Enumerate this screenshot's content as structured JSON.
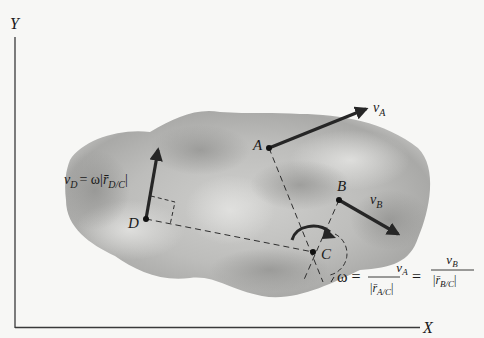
{
  "figure": {
    "axes": {
      "y_label": "Y",
      "x_label": "X"
    },
    "points": {
      "A": {
        "label": "A"
      },
      "B": {
        "label": "B"
      },
      "C": {
        "label": "C"
      },
      "D": {
        "label": "D"
      }
    },
    "velocities": {
      "vA": {
        "symbol": "v",
        "sub": "A"
      },
      "vB": {
        "symbol": "v",
        "sub": "B"
      },
      "vD": {
        "symbol": "v",
        "sub": "D",
        "rhs_prefix": "= ω|",
        "r": "r̄",
        "r_sub": "D/C",
        "rhs_suffix": "|"
      }
    },
    "equation": {
      "omega": "ω =",
      "frac1_num_symbol": "v",
      "frac1_num_sub": "A",
      "frac1_den_prefix": "|",
      "frac1_den_r": "r̄",
      "frac1_den_sub": "A/C",
      "frac1_den_suffix": "|",
      "equals": "=",
      "frac2_num_symbol": "v",
      "frac2_num_sub": "B",
      "frac2_den_prefix": "|",
      "frac2_den_r": "r̄",
      "frac2_den_sub": "B/C",
      "frac2_den_suffix": "|"
    },
    "colors": {
      "ink": "#1a1a1a",
      "body_light": "#d9d9d7",
      "body_dark": "#9d9d9b",
      "background": "#f7f7f5"
    }
  }
}
